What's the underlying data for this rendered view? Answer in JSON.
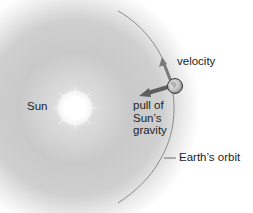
{
  "diagram": {
    "labels": {
      "sun": "Sun",
      "velocity": "velocity",
      "gravity_line1": "pull of",
      "gravity_line2": "Sun’s",
      "gravity_line3": "gravity",
      "orbit": "Earth’s orbit"
    },
    "colors": {
      "glow_inner": "#ffffff",
      "glow_mid": "#c8c8c8",
      "glow_outer": "#ffffff",
      "orbit_line": "#8a8a8a",
      "arrow": "#6e6e6e",
      "text": "#222222"
    }
  }
}
